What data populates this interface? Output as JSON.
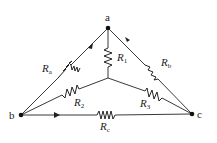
{
  "diagram": {
    "nodes": [
      {
        "id": "a",
        "label": "a"
      },
      {
        "id": "b",
        "label": "b"
      },
      {
        "id": "c",
        "label": "c"
      }
    ],
    "resistors": [
      {
        "id": "Ra",
        "symbol": "R",
        "sub": "a",
        "between": [
          "a",
          "b"
        ]
      },
      {
        "id": "Rb",
        "symbol": "R",
        "sub": "b",
        "between": [
          "a",
          "c"
        ]
      },
      {
        "id": "Rc",
        "symbol": "R",
        "sub": "c",
        "between": [
          "b",
          "c"
        ]
      },
      {
        "id": "R1",
        "symbol": "R",
        "sub": "1",
        "between": [
          "a",
          "center"
        ]
      },
      {
        "id": "R2",
        "symbol": "R",
        "sub": "2",
        "between": [
          "b",
          "center"
        ]
      },
      {
        "id": "R3",
        "symbol": "R",
        "sub": "3",
        "between": [
          "c",
          "center"
        ]
      }
    ]
  }
}
